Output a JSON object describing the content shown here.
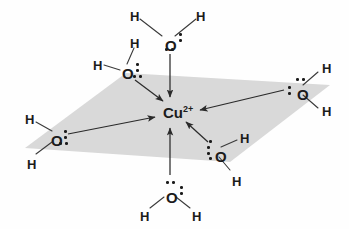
{
  "figure": {
    "center": {
      "symbol": "Cu",
      "charge": "2+",
      "x": 163,
      "y": 105
    },
    "plane": {
      "fill": "#d9d9d9",
      "points": "25,148 126,73 330,85 230,162"
    },
    "colors": {
      "atom": "#1b1b1b",
      "arrow": "#2a2a2a",
      "bond": "#3a3a3a",
      "plane": "#d9d9d9",
      "background": "#fefefe"
    },
    "ligands": [
      {
        "id": "top",
        "name": "water-top",
        "oxygen": {
          "label": "O",
          "x": 165,
          "y": 38
        },
        "hydrogens": [
          {
            "label": "H",
            "x": 130,
            "y": 10
          },
          {
            "label": "H",
            "x": 196,
            "y": 10
          }
        ],
        "bonds": [
          {
            "x1": 162,
            "y1": 36,
            "x2": 140,
            "y2": 19
          },
          {
            "x1": 175,
            "y1": 36,
            "x2": 196,
            "y2": 19
          }
        ],
        "lone_pairs": [
          {
            "x": 179,
            "y": 33
          },
          {
            "x": 179,
            "y": 39
          },
          {
            "x": 165,
            "y": 48
          },
          {
            "x": 171,
            "y": 48
          }
        ],
        "arrow": {
          "x1": 170,
          "y1": 54,
          "x2": 170,
          "y2": 97
        }
      },
      {
        "id": "upper-left",
        "name": "water-upper-left",
        "oxygen": {
          "label": "O",
          "x": 122,
          "y": 66
        },
        "hydrogens": [
          {
            "label": "H",
            "x": 130,
            "y": 37
          },
          {
            "label": "H",
            "x": 93,
            "y": 59
          }
        ],
        "bonds": [
          {
            "x1": 127,
            "y1": 64,
            "x2": 134,
            "y2": 48
          },
          {
            "x1": 120,
            "y1": 70,
            "x2": 104,
            "y2": 65
          }
        ],
        "lone_pairs": [
          {
            "x": 136,
            "y": 63
          },
          {
            "x": 136,
            "y": 69
          },
          {
            "x": 133,
            "y": 75
          },
          {
            "x": 139,
            "y": 75
          }
        ],
        "arrow": {
          "x1": 135,
          "y1": 80,
          "x2": 163,
          "y2": 101
        }
      },
      {
        "id": "left",
        "name": "water-left",
        "oxygen": {
          "label": "O",
          "x": 51,
          "y": 133
        },
        "hydrogens": [
          {
            "label": "H",
            "x": 25,
            "y": 113
          },
          {
            "label": "H",
            "x": 27,
            "y": 158
          }
        ],
        "bonds": [
          {
            "x1": 52,
            "y1": 131,
            "x2": 36,
            "y2": 122
          },
          {
            "x1": 52,
            "y1": 142,
            "x2": 36,
            "y2": 154
          }
        ],
        "lone_pairs": [
          {
            "x": 64,
            "y": 130
          },
          {
            "x": 64,
            "y": 136
          },
          {
            "x": 59,
            "y": 142
          },
          {
            "x": 65,
            "y": 142
          }
        ],
        "arrow": {
          "x1": 68,
          "y1": 134,
          "x2": 155,
          "y2": 117
        }
      },
      {
        "id": "right",
        "name": "water-right",
        "oxygen": {
          "label": "O",
          "x": 297,
          "y": 87
        },
        "hydrogens": [
          {
            "label": "H",
            "x": 322,
            "y": 62
          },
          {
            "label": "H",
            "x": 322,
            "y": 105
          }
        ],
        "bonds": [
          {
            "x1": 303,
            "y1": 85,
            "x2": 318,
            "y2": 72
          },
          {
            "x1": 303,
            "y1": 95,
            "x2": 318,
            "y2": 108
          }
        ],
        "lone_pairs": [
          {
            "x": 296,
            "y": 78
          },
          {
            "x": 302,
            "y": 78
          },
          {
            "x": 288,
            "y": 86
          },
          {
            "x": 288,
            "y": 92
          }
        ],
        "arrow": {
          "x1": 284,
          "y1": 90,
          "x2": 200,
          "y2": 110
        }
      },
      {
        "id": "lower-right",
        "name": "water-lower-right",
        "oxygen": {
          "label": "O",
          "x": 215,
          "y": 149
        },
        "hydrogens": [
          {
            "label": "H",
            "x": 240,
            "y": 132
          },
          {
            "label": "H",
            "x": 232,
            "y": 175
          }
        ],
        "bonds": [
          {
            "x1": 221,
            "y1": 147,
            "x2": 237,
            "y2": 140
          },
          {
            "x1": 219,
            "y1": 157,
            "x2": 230,
            "y2": 170
          }
        ],
        "lone_pairs": [
          {
            "x": 207,
            "y": 146
          },
          {
            "x": 207,
            "y": 152
          },
          {
            "x": 209,
            "y": 157
          },
          {
            "x": 209,
            "y": 140
          }
        ],
        "arrow": {
          "x1": 208,
          "y1": 142,
          "x2": 186,
          "y2": 122
        }
      },
      {
        "id": "bottom",
        "name": "water-bottom",
        "oxygen": {
          "label": "O",
          "x": 166,
          "y": 190
        },
        "hydrogens": [
          {
            "label": "H",
            "x": 140,
            "y": 210
          },
          {
            "label": "H",
            "x": 192,
            "y": 210
          }
        ],
        "bonds": [
          {
            "x1": 164,
            "y1": 197,
            "x2": 150,
            "y2": 208
          },
          {
            "x1": 176,
            "y1": 197,
            "x2": 190,
            "y2": 208
          }
        ],
        "lone_pairs": [
          {
            "x": 166,
            "y": 181
          },
          {
            "x": 172,
            "y": 181
          },
          {
            "x": 180,
            "y": 186
          },
          {
            "x": 180,
            "y": 192
          }
        ],
        "arrow": {
          "x1": 170,
          "y1": 175,
          "x2": 170,
          "y2": 128
        }
      }
    ]
  }
}
